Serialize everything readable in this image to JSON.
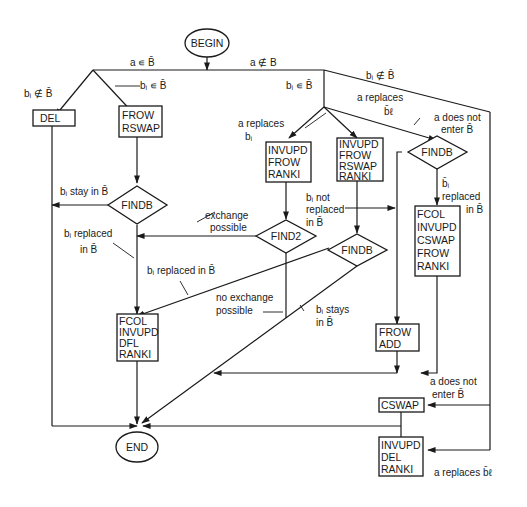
{
  "diagram": {
    "type": "flowchart",
    "nodes": {
      "begin": "BEGIN",
      "end": "END",
      "del_box": [
        "DEL"
      ],
      "frow_rswap_box": [
        "FROW",
        "RSWAP"
      ],
      "findb_left": "FINDB",
      "invupd_frow_ranki_box": [
        "INVUPD",
        "FROW",
        "RANKI"
      ],
      "invupd_frow_rswap_ranki_box": [
        "INVUPD",
        "FROW",
        "RSWAP",
        "RANKI"
      ],
      "findb_right": "FINDB",
      "find2": "FIND2",
      "findb_middle": "FINDB",
      "fcol_invupd_cswap_frow_ranki_box": [
        "FCOL",
        "INVUPD",
        "CSWAP",
        "FROW",
        "RANKI"
      ],
      "fcol_invupd_dfl_ranki_box": [
        "FCOL",
        "INVUPD",
        "DFL",
        "RANKI"
      ],
      "frow_add_box": [
        "FROW",
        "ADD"
      ],
      "cswap_box": [
        "CSWAP"
      ],
      "invupd_del_ranki_box": [
        "INVUPD",
        "DEL",
        "RANKI"
      ]
    },
    "edge_labels": {
      "a_in_bbar": "a ∊ B̄",
      "a_notin_b": "a ∉ B",
      "bi_notin_bbar_left": "bᵢ ∉ B̄",
      "bi_in_bbar_left": "bᵢ ∊ B̄",
      "bi_in_bbar_right": "bᵢ ∊ B̄",
      "bi_notin_bbar_right": "bᵢ ∉ B̄",
      "a_replaces_bl_top": [
        "a replaces",
        "b̄ℓ"
      ],
      "a_replaces_bi": [
        "a replaces",
        "bᵢ"
      ],
      "a_does_not_enter_top": [
        "a does not",
        "enter B̄"
      ],
      "bi_stay_in_bbar": "bᵢ stay in B̄",
      "exchange_possible": [
        "exchange",
        "possible"
      ],
      "bi_replaced_in_bbar_1": [
        "bᵢ replaced",
        "in B̄"
      ],
      "bi_not_replaced": [
        "bᵢ not",
        "replaced",
        "in B̄"
      ],
      "bbar_i_replaced": [
        "b̄ᵢ",
        "replaced",
        "in B̄"
      ],
      "bi_replaced_in_bbar_2": "bᵢ replaced in B̄",
      "no_exchange_possible": [
        "no exchange",
        "possible"
      ],
      "bi_stays_in_bbar": [
        "bᵢ stays",
        "in B̄"
      ],
      "a_does_not_enter_bottom": [
        "a does not",
        "enter B̄"
      ],
      "a_replaces_bl_bottom": "a replaces b̄ℓ"
    }
  }
}
